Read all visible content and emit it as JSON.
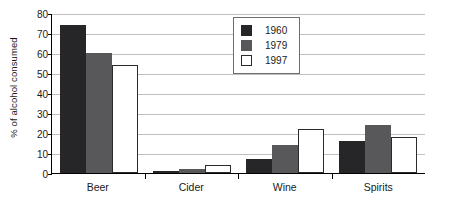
{
  "chart_data": {
    "type": "bar",
    "title": "",
    "subtitle": "",
    "xlabel": "",
    "ylabel": "% of alcohol consumed",
    "categories": [
      "Beer",
      "Cider",
      "Wine",
      "Spirits"
    ],
    "series": [
      {
        "name": "1960",
        "color": "#262628",
        "values": [
          74,
          1,
          7,
          16
        ]
      },
      {
        "name": "1979",
        "color": "#58585a",
        "values": [
          60,
          2,
          14,
          24
        ]
      },
      {
        "name": "1997",
        "color": "#ffffff",
        "values": [
          54,
          4,
          22,
          18
        ]
      }
    ],
    "ylim": [
      0,
      80
    ],
    "ytick_step": 10,
    "ytick_labels": [
      "0",
      "10",
      "20",
      "30",
      "40",
      "50",
      "60",
      "70",
      "80"
    ],
    "grid": true,
    "grid_axis": "y",
    "legend_position": "top-center",
    "legend_border": true
  },
  "axes": {
    "y_title": "% of alcohol consumed"
  },
  "colors": {
    "series_1960": "#262628",
    "series_1979": "#58585a",
    "series_1997": "#ffffff",
    "gridline": "#bfbfbf",
    "axis": "#000000",
    "legend_border": "#6e6e6e",
    "text": "#1a1a1a",
    "background": "#ffffff"
  }
}
